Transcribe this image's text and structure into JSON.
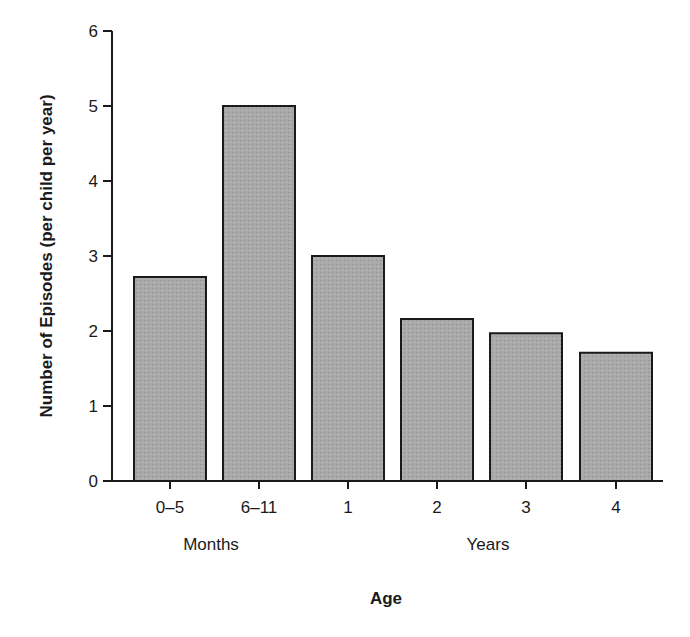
{
  "chart_data": {
    "type": "bar",
    "title": "",
    "xlabel": "Age",
    "ylabel": "Number of Episodes (per child per year)",
    "categories": [
      "0–5",
      "6–11",
      "1",
      "2",
      "3",
      "4"
    ],
    "category_groups": [
      {
        "label": "Months",
        "categories": [
          "0–5",
          "6–11"
        ]
      },
      {
        "label": "Years",
        "categories": [
          "1",
          "2",
          "3",
          "4"
        ]
      }
    ],
    "values": [
      2.72,
      5.0,
      3.0,
      2.16,
      1.97,
      1.71
    ],
    "ylim": [
      0,
      6
    ],
    "yticks": [
      0,
      1,
      2,
      3,
      4,
      5,
      6
    ],
    "grid": false,
    "legend": null
  },
  "colors": {
    "bar_fill": "#a9a9a9",
    "bar_stroke": "#1a1a1a",
    "axis": "#1a1a1a"
  },
  "labels": {
    "months": "Months",
    "years": "Years",
    "x_title": "Age",
    "y_title": "Number of Episodes (per child per year)"
  }
}
